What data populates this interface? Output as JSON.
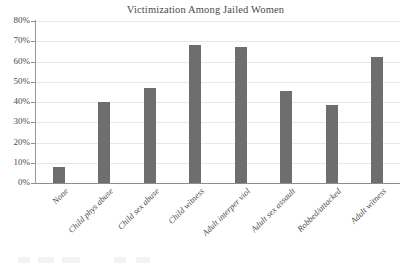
{
  "chart_data": {
    "type": "bar",
    "title": "Victimization Among Jailed Women",
    "xlabel": "",
    "ylabel": "",
    "ylim": [
      0,
      80
    ],
    "ytick_labels": [
      "80%",
      "70%",
      "60%",
      "50%",
      "40%",
      "30%",
      "20%",
      "10%",
      "0%"
    ],
    "ytick_values": [
      80,
      70,
      60,
      50,
      40,
      30,
      20,
      10,
      0
    ],
    "grid": true,
    "legend": "none",
    "bar_color": "#6e6e6e",
    "categories": [
      "None",
      "Child phys abuse",
      "Child sex abuse",
      "Child witness",
      "Adult interper viol",
      "Adult sex assault",
      "Robbed/attacked",
      "Adult witness"
    ],
    "values": [
      8,
      40,
      47,
      68,
      67,
      45.5,
      38.5,
      62
    ],
    "value_labels": [
      "8%",
      "40%",
      "47%",
      "68%",
      "67%",
      "45.5%",
      "38.5%",
      "62%"
    ]
  }
}
